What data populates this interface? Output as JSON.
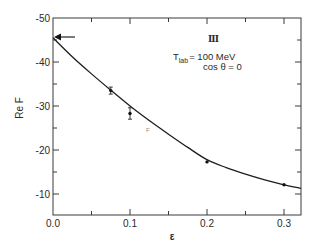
{
  "chart_data": {
    "type": "line",
    "title": "",
    "xlabel": "ε",
    "ylabel": "Re F",
    "xlim": [
      0.0,
      0.322
    ],
    "ylim": [
      -5.2,
      -50
    ],
    "x_ticks": [
      {
        "value": 0.0,
        "label": "0.0"
      },
      {
        "value": 0.1,
        "label": "0.1"
      },
      {
        "value": 0.2,
        "label": "0.2"
      },
      {
        "value": 0.3,
        "label": "0.3"
      }
    ],
    "x_minor_ticks": [
      0.05,
      0.15,
      0.25
    ],
    "y_ticks": [
      {
        "value": -50,
        "label": "-50"
      },
      {
        "value": -40,
        "label": "-40"
      },
      {
        "value": -30,
        "label": "-30"
      },
      {
        "value": -20,
        "label": "-20"
      },
      {
        "value": -10,
        "label": "-10"
      }
    ],
    "y_minor_ticks": [
      -45,
      -35,
      -25,
      -15
    ],
    "grid": false,
    "legend": null,
    "series": [
      {
        "name": "data points",
        "style": "markers with error bars",
        "points": [
          {
            "x": 0.075,
            "y": -33.5,
            "err": 0.8
          },
          {
            "x": 0.1,
            "y": -28.3,
            "err": 1.3
          },
          {
            "x": 0.2,
            "y": -17.3,
            "err": 0.2
          },
          {
            "x": 0.3,
            "y": -12.1,
            "err": 0.2
          }
        ]
      },
      {
        "name": "fit curve",
        "style": "solid line",
        "points": [
          {
            "x": 0.0,
            "y": -45.5
          },
          {
            "x": 0.025,
            "y": -41.2
          },
          {
            "x": 0.05,
            "y": -37.3
          },
          {
            "x": 0.075,
            "y": -33.6
          },
          {
            "x": 0.1,
            "y": -30.0
          },
          {
            "x": 0.125,
            "y": -26.7
          },
          {
            "x": 0.15,
            "y": -23.6
          },
          {
            "x": 0.175,
            "y": -20.6
          },
          {
            "x": 0.2,
            "y": -17.8
          },
          {
            "x": 0.225,
            "y": -16.0
          },
          {
            "x": 0.25,
            "y": -14.5
          },
          {
            "x": 0.275,
            "y": -13.2
          },
          {
            "x": 0.3,
            "y": -12.1
          },
          {
            "x": 0.322,
            "y": -11.3
          }
        ]
      }
    ],
    "annotations": [
      {
        "text": "III",
        "type": "panel-label"
      },
      {
        "text": "T_lab = 100 MeV",
        "type": "condition"
      },
      {
        "text": "cos θ = 0",
        "type": "condition"
      },
      {
        "type": "arrow",
        "points_to": {
          "x": 0.0,
          "y": -45.5
        },
        "direction": "left"
      }
    ]
  },
  "labels": {
    "panel": "III",
    "tlab_main": "T",
    "tlab_sub": "lab",
    "tlab_value": "= 100 MeV",
    "cos_theta": "cos  θ = 0",
    "ylabel": "Re F",
    "xlabel": "ε",
    "stray_mark": "F"
  }
}
